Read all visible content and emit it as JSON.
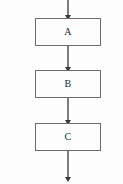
{
  "diagram": {
    "type": "flowchart",
    "orientation": "vertical",
    "background_color": "#fdfdfd",
    "box_border_color": "#6b6b6b",
    "box_fill_color": "#fdfdfd",
    "connector_color": "#3a3a3a",
    "label_color": "#2b2b2b",
    "nodes": [
      {
        "id": "A",
        "label": "A",
        "x": 35,
        "y": 18,
        "width": 66,
        "height": 28
      },
      {
        "id": "B",
        "label": "B",
        "x": 35,
        "y": 70,
        "width": 66,
        "height": 28
      },
      {
        "id": "C",
        "label": "C",
        "x": 35,
        "y": 123,
        "width": 66,
        "height": 28
      }
    ],
    "connectors": [
      {
        "id": "entry-arrow",
        "from": "top-edge",
        "to": "A",
        "x": 68,
        "y_start": 0,
        "y_end": 18
      },
      {
        "id": "arrow-a-to-b",
        "from": "A",
        "to": "B",
        "x": 68,
        "y_start": 46,
        "y_end": 70
      },
      {
        "id": "arrow-b-to-c",
        "from": "B",
        "to": "C",
        "x": 68,
        "y_start": 98,
        "y_end": 123
      },
      {
        "id": "exit-arrow",
        "from": "C",
        "to": "bottom-edge",
        "x": 68,
        "y_start": 151,
        "y_end": 180
      }
    ]
  }
}
